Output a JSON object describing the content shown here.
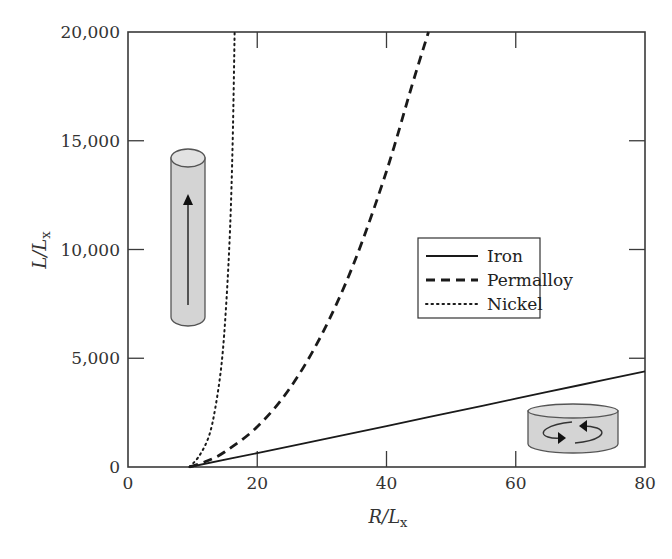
{
  "chart_data": {
    "type": "line",
    "title": "",
    "xlabel": "R/L_x",
    "ylabel": "L/L_x",
    "xlim": [
      0,
      80
    ],
    "ylim": [
      0,
      20000
    ],
    "x_ticks": [
      0,
      20,
      40,
      60,
      80
    ],
    "x_tick_labels": [
      "0",
      "20",
      "40",
      "60",
      "80"
    ],
    "y_ticks": [
      0,
      5000,
      10000,
      15000,
      20000
    ],
    "y_tick_labels": [
      "0",
      "5,000",
      "10,000",
      "15,000",
      "20,000"
    ],
    "grid": false,
    "legend_position": "center-right",
    "series": [
      {
        "name": "Iron",
        "style": "solid",
        "x": [
          9.5,
          20,
          30,
          40,
          50,
          60,
          70,
          80
        ],
        "y": [
          0,
          640,
          1260,
          1880,
          2510,
          3140,
          3770,
          4400
        ]
      },
      {
        "name": "Permalloy",
        "style": "dashed",
        "x": [
          9.5,
          12,
          15,
          20,
          25,
          30,
          35,
          40,
          44,
          46.5
        ],
        "y": [
          0,
          250,
          700,
          1850,
          3600,
          6100,
          9400,
          13600,
          17600,
          20000
        ]
      },
      {
        "name": "Nickel",
        "style": "dotted",
        "x": [
          9.5,
          11,
          12.5,
          13.5,
          14.5,
          15.2,
          15.8,
          16.2,
          16.5
        ],
        "y": [
          0,
          500,
          1400,
          2700,
          4800,
          7500,
          11000,
          15000,
          20000
        ]
      }
    ],
    "annotations": [
      {
        "type": "illustration",
        "name": "tall-cylinder-axial-magnetization",
        "position": "upper-left"
      },
      {
        "type": "illustration",
        "name": "flat-disk-vortex-magnetization",
        "position": "lower-right"
      }
    ]
  },
  "axes": {
    "x_label_main": "R/L",
    "x_label_sub": "x",
    "y_label_main": "L/L",
    "y_label_sub": "x"
  },
  "legend": {
    "items": [
      {
        "label": "Iron",
        "style": "solid"
      },
      {
        "label": "Permalloy",
        "style": "dashed"
      },
      {
        "label": "Nickel",
        "style": "dotted"
      }
    ]
  },
  "colors": {
    "line": "#1a1a1a",
    "axis": "#3a3a3a",
    "illustration_fill": "#d4d4d4",
    "illustration_stroke": "#555555"
  }
}
